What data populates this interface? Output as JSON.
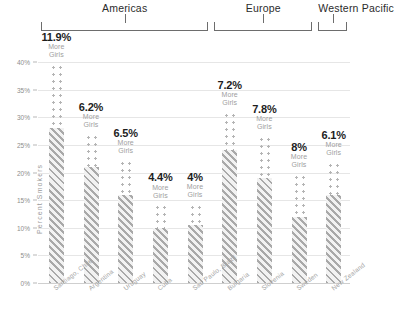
{
  "chart_data": {
    "type": "bar",
    "title": "",
    "subtitle": "",
    "xlabel": "",
    "ylabel": "Percent Smokers",
    "ylim": [
      0,
      40
    ],
    "ytick_labels": [
      "0%",
      "5%",
      "10%",
      "15%",
      "20%",
      "25%",
      "30%",
      "35%",
      "40%"
    ],
    "ytick_values": [
      0,
      5,
      10,
      15,
      20,
      25,
      30,
      35,
      40
    ],
    "grid": true,
    "legend_position": "none",
    "annotation_suffix_line1": "More",
    "annotation_suffix_line2": "Girls",
    "region_groups": [
      {
        "name": "Americas",
        "label": "Americas",
        "start_index": 0,
        "end_index": 4
      },
      {
        "name": "Europe",
        "label": "Europe",
        "start_index": 5,
        "end_index": 7
      },
      {
        "name": "Western Pacific",
        "label": "Western Pacific",
        "start_index": 8,
        "end_index": 8
      }
    ],
    "series": [
      {
        "name": "Boys",
        "pattern": "diagonal-hatch",
        "values": [
          28.0,
          21.0,
          16.0,
          10.0,
          10.5,
          24.0,
          19.0,
          12.0,
          16.0
        ]
      },
      {
        "name": "Girls",
        "pattern": "dots",
        "values": [
          39.9,
          27.2,
          22.5,
          14.4,
          14.5,
          31.2,
          26.8,
          20.0,
          22.1
        ]
      }
    ],
    "categories": [
      "Santiago, Chile",
      "Argentina",
      "Uruguay",
      "Cuba",
      "Sao Paulo, Brazil",
      "Bulgaria",
      "Slovenia",
      "Sweden",
      "New Zealand"
    ],
    "difference_labels": [
      "11.9%",
      "6.2%",
      "6.5%",
      "4.4%",
      "4%",
      "7.2%",
      "7.8%",
      "8%",
      "6.1%"
    ],
    "difference_values": [
      11.9,
      6.2,
      6.5,
      4.4,
      4.0,
      7.2,
      7.8,
      8.0,
      6.1
    ],
    "colors": {
      "hatch": "#a9a9a9",
      "dots": "#b4b4b4",
      "gridline": "#e6e6e6",
      "value_text": "#1d1d1d",
      "muted_text": "#9e9e9e",
      "axis_text": "#8d8d8d"
    }
  }
}
